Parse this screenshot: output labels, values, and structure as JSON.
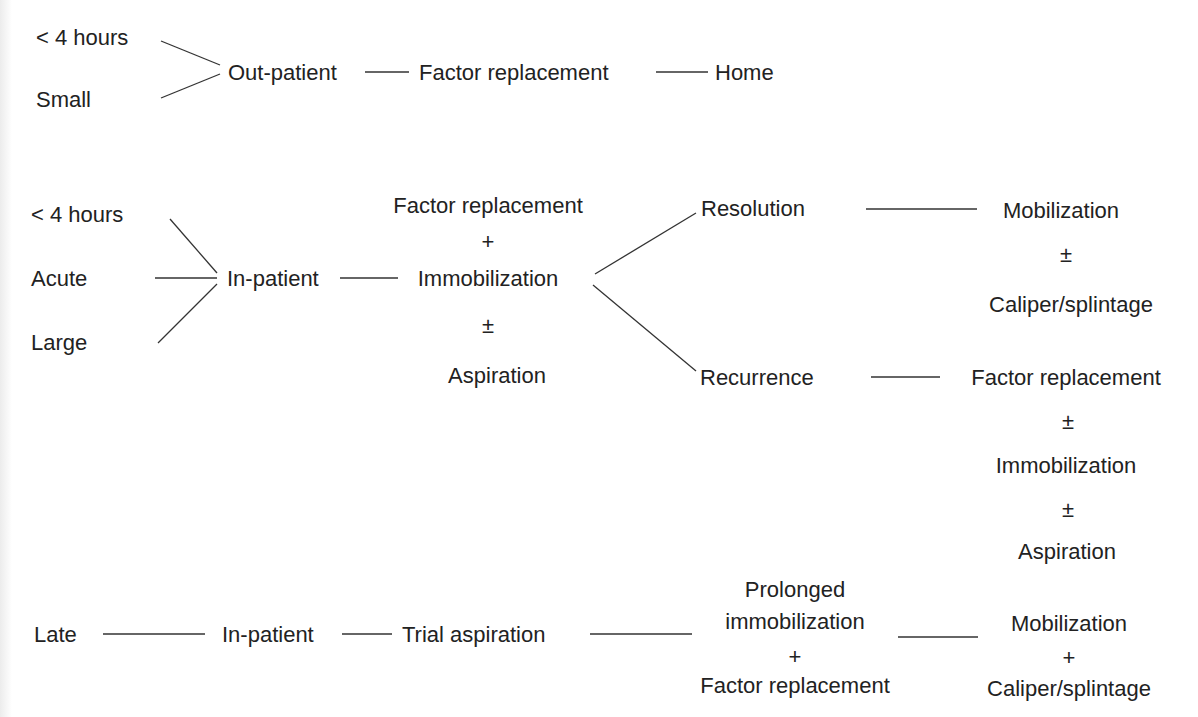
{
  "diagram": {
    "branch1": {
      "inputs": [
        "< 4 hours",
        "Small"
      ],
      "setting": "Out-patient",
      "treatment": "Factor replacement",
      "outcome": "Home"
    },
    "branch2": {
      "inputs": [
        "< 4 hours",
        "Acute",
        "Large"
      ],
      "setting": "In-patient",
      "treatment": [
        "Factor replacement",
        "+",
        "Immobilization",
        "±",
        "Aspiration"
      ],
      "resolution": {
        "label": "Resolution",
        "next": [
          "Mobilization",
          "±",
          "Caliper/splintage"
        ]
      },
      "recurrence": {
        "label": "Recurrence",
        "next": [
          "Factor replacement",
          "±",
          "Immobilization",
          "±",
          "Aspiration"
        ]
      }
    },
    "branch3": {
      "input": "Late",
      "setting": "In-patient",
      "step": "Trial aspiration",
      "treatment": [
        "Prolonged",
        "immobilization",
        "+",
        "Factor replacement"
      ],
      "outcome": [
        "Mobilization",
        "+",
        "Caliper/splintage"
      ]
    }
  }
}
